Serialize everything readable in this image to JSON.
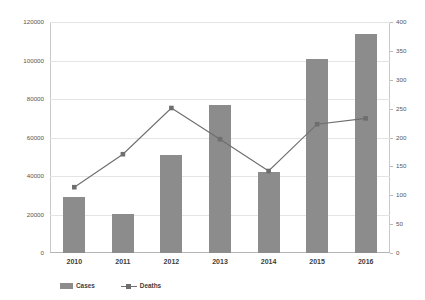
{
  "chart_data": {
    "type": "bar",
    "title": "",
    "subtitle": "",
    "xlabel": "",
    "ylabel": "",
    "categories": [
      "2010",
      "2011",
      "2012",
      "2013",
      "2014",
      "2015",
      "2016"
    ],
    "series": [
      {
        "name": "Cases",
        "type": "bar",
        "axis": "left",
        "color": "#8c8c8c",
        "values": [
          29000,
          20500,
          51000,
          77000,
          42000,
          101000,
          114000
        ]
      },
      {
        "name": "Deaths",
        "type": "line",
        "axis": "right",
        "color": "#6e6e6e",
        "marker": "square",
        "values": [
          114,
          171,
          251,
          197,
          142,
          223,
          233
        ]
      }
    ],
    "left_axis": {
      "label": "",
      "ylim": [
        0,
        120000
      ],
      "ticks": [
        0,
        20000,
        40000,
        60000,
        80000,
        100000,
        120000
      ],
      "tick_labels": [
        "0",
        "20000",
        "40000",
        "60000",
        "80000",
        "100000",
        "120000"
      ]
    },
    "right_axis": {
      "label": "",
      "ylim": [
        0,
        400
      ],
      "ticks": [
        0,
        50,
        100,
        150,
        200,
        250,
        300,
        350,
        400
      ],
      "tick_labels": [
        "0",
        "50",
        "100",
        "150",
        "200",
        "250",
        "300",
        "350",
        "400"
      ]
    },
    "grid": true,
    "grid_axis": "left",
    "legend": {
      "position": "bottom-left",
      "entries": [
        {
          "label": "Cases",
          "marker": "bar-swatch",
          "color": "#8c8c8c"
        },
        {
          "label": "Deaths",
          "marker": "line-square",
          "color": "#6e6e6e"
        }
      ]
    },
    "background": "#ffffff"
  }
}
